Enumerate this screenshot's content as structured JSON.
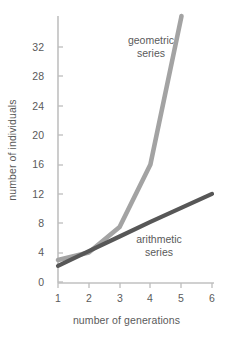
{
  "chart_data": {
    "type": "line",
    "title": "",
    "xlabel": "number of generations",
    "ylabel": "number of individuals",
    "x": [
      1,
      2,
      3,
      4,
      5,
      6
    ],
    "xlim": [
      1,
      6
    ],
    "ylim": [
      0,
      36
    ],
    "xticks": [
      "1",
      "2",
      "3",
      "4",
      "5",
      "6"
    ],
    "yticks": [
      "0",
      "4",
      "8",
      "12",
      "16",
      "20",
      "24",
      "28",
      "32"
    ],
    "grid": false,
    "legend_position": "inline-annotation",
    "series": [
      {
        "name": "geometric series",
        "color": "#a3a3a3",
        "values": [
          3,
          4,
          7.5,
          16,
          36,
          null
        ],
        "note": "rises off the top of the plot between generation 5 and 6"
      },
      {
        "name": "arithmetic series",
        "color": "#575757",
        "values": [
          2.2,
          4.2,
          6.2,
          8.2,
          10.1,
          12
        ]
      }
    ],
    "annotations": [
      {
        "text_line1": "geometric",
        "text_line2": "series"
      },
      {
        "text_line1": "arithmetic",
        "text_line2": "series"
      }
    ]
  },
  "axis": {
    "y_label": "number of individuals",
    "x_label": "number of generations",
    "y_ticks": [
      "32",
      "28",
      "24",
      "20",
      "16",
      "12",
      "8",
      "4",
      "0"
    ],
    "x_ticks": [
      "1",
      "2",
      "3",
      "4",
      "5",
      "6"
    ]
  },
  "labels": {
    "geometric_line1": "geometric",
    "geometric_line2": "series",
    "arithmetic_line1": "arithmetic",
    "arithmetic_line2": "series"
  },
  "colors": {
    "geometric": "#a3a3a3",
    "arithmetic": "#575757",
    "axis": "#b4b4b4",
    "text": "#5a5a5a",
    "background": "#ffffff"
  }
}
